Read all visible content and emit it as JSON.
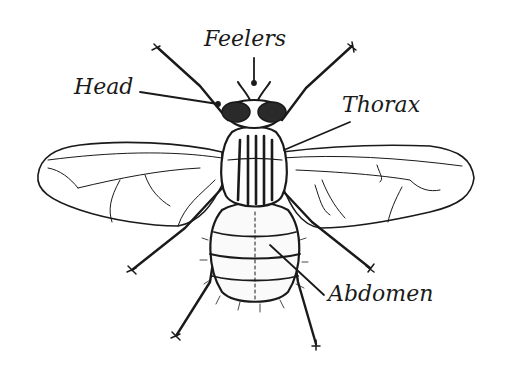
{
  "diagram": {
    "labels": [
      {
        "id": "feelers",
        "text": "Feelers"
      },
      {
        "id": "head",
        "text": "Head"
      },
      {
        "id": "thorax",
        "text": "Thorax"
      },
      {
        "id": "abdomen",
        "text": "Abdomen"
      }
    ],
    "colors": {
      "ink": "#1a1a1a",
      "background": "#ffffff"
    }
  }
}
